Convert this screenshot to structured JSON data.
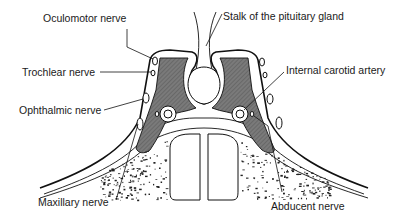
{
  "diagram": {
    "labels": {
      "oculomotor": "Oculomotor nerve",
      "trochlear": "Trochlear nerve",
      "ophthalmic": "Ophthalmic nerve",
      "maxillary": "Maxillary nerve",
      "stalk": "Stalk of the pituitary gland",
      "carotid": "Internal carotid artery",
      "abducent": "Abducent nerve"
    },
    "colors": {
      "sinus_fill": "#6f6f6f",
      "line": "#111111",
      "background": "#ffffff"
    }
  }
}
